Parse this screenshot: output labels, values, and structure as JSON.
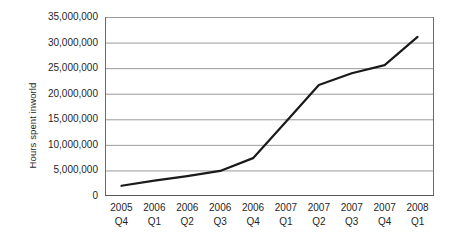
{
  "chart_data": {
    "type": "line",
    "title": "",
    "xlabel": "",
    "ylabel": "Hours spent inworld",
    "categories": [
      "2005 Q4",
      "2006 Q1",
      "2006 Q2",
      "2006 Q3",
      "2006 Q4",
      "2007 Q1",
      "2007 Q2",
      "2007 Q3",
      "2007 Q4",
      "2008 Q1"
    ],
    "category_lines": [
      {
        "year": "2005",
        "quarter": "Q4"
      },
      {
        "year": "2006",
        "quarter": "Q1"
      },
      {
        "year": "2006",
        "quarter": "Q2"
      },
      {
        "year": "2006",
        "quarter": "Q3"
      },
      {
        "year": "2006",
        "quarter": "Q4"
      },
      {
        "year": "2007",
        "quarter": "Q1"
      },
      {
        "year": "2007",
        "quarter": "Q2"
      },
      {
        "year": "2007",
        "quarter": "Q3"
      },
      {
        "year": "2007",
        "quarter": "Q4"
      },
      {
        "year": "2008",
        "quarter": "Q1"
      }
    ],
    "values": [
      2000000,
      3000000,
      3900000,
      4900000,
      7400000,
      14500000,
      21700000,
      24000000,
      25600000,
      31100000
    ],
    "ylim": [
      0,
      35000000
    ],
    "ytick_values": [
      0,
      5000000,
      10000000,
      15000000,
      20000000,
      25000000,
      30000000,
      35000000
    ],
    "ytick_labels": [
      "0",
      "5,000,000",
      "10,000,000",
      "15,000,000",
      "20,000,000",
      "25,000,000",
      "30,000,000",
      "35,000,000"
    ],
    "grid": true,
    "legend": "none",
    "line_color": "#1a1a1a",
    "grid_color": "#9a9a9a",
    "axis_color": "#6b6b6b",
    "background_color": "#ffffff"
  }
}
